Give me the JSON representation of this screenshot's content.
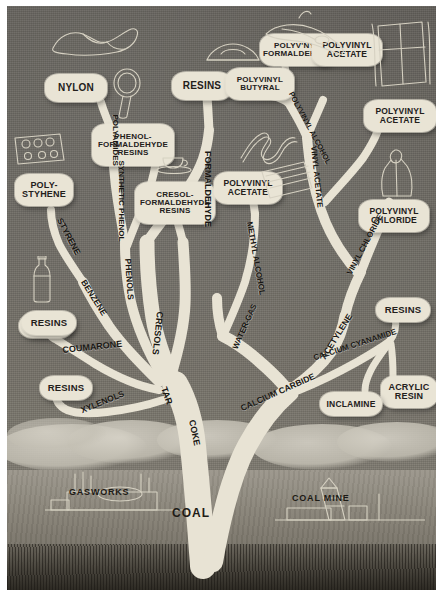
{
  "plate": {
    "title": "Chemical products derived from coal",
    "background_color": "#6e6a63",
    "limb_color": "#e8e3d4",
    "label_color": "#e9e4d5",
    "text_color": "#23201b"
  },
  "trunk": {
    "root_label": "COAL",
    "ground_left": "GASWORKS",
    "ground_right": "COAL MINE"
  },
  "branch_labels": [
    {
      "id": "tar",
      "text": "TAR"
    },
    {
      "id": "coke",
      "text": "COKE"
    },
    {
      "id": "water-gas",
      "text": "WATER-GAS"
    },
    {
      "id": "calcium-carbide",
      "text": "CALCIUM CARBIDE"
    },
    {
      "id": "calcium-cyanamide",
      "text": "CALCIUM CYANAMIDE"
    },
    {
      "id": "acetylene",
      "text": "ACETYLENE"
    },
    {
      "id": "vinyl-chloride",
      "text": "VINYL CHLORIDE"
    },
    {
      "id": "vinyl-acetate",
      "text": "VINYL ACETATE"
    },
    {
      "id": "polyvinyl-alcohol",
      "text": "POLYVINYL ALCOHOL"
    },
    {
      "id": "methyl-alcohol",
      "text": "METHYL ALCOHOL"
    },
    {
      "id": "formaldehyde",
      "text": "FORMALDEHYDE"
    },
    {
      "id": "cresols",
      "text": "CRESOLS"
    },
    {
      "id": "phenols",
      "text": "PHENOLS"
    },
    {
      "id": "benzene",
      "text": "BENZENE"
    },
    {
      "id": "coumarone",
      "text": "COUMARONE"
    },
    {
      "id": "xylenols",
      "text": "XYLENOLS"
    },
    {
      "id": "styrene",
      "text": "STYRENE"
    },
    {
      "id": "synthetic-phenol",
      "text": "SYNTHETIC PHENOL"
    },
    {
      "id": "polyamides",
      "text": "POLYAMIDES"
    }
  ],
  "products": [
    {
      "id": "nylon",
      "text": "NYLON"
    },
    {
      "id": "phenol-formaldehyde-resins",
      "text": "PHENOL-\nFORMALDEHYDE\nRESINS"
    },
    {
      "id": "cresol-formaldehyde-resins",
      "text": "CRESOL-\nFORMALDEHYDE\nRESINS"
    },
    {
      "id": "polystyrene",
      "text": "POLY-\nSTYHENE"
    },
    {
      "id": "resins-styrene",
      "text": "RESINS"
    },
    {
      "id": "resins-coumarone",
      "text": "RESINS"
    },
    {
      "id": "resins-xylenols",
      "text": "RESINS"
    },
    {
      "id": "resins-formaldehyde",
      "text": "RESINS"
    },
    {
      "id": "polyvinyl-formaldehyde",
      "text": "POLYV'NYL\nFORMALDEHYDE"
    },
    {
      "id": "polyvinyl-butyral",
      "text": "POLYVINYL\nBUTYRAL"
    },
    {
      "id": "polyvinyl-acetate-top",
      "text": "POLYVINYL\nACETATE"
    },
    {
      "id": "polyvinyl-acetate-right",
      "text": "POLYVINYL\nACETATE"
    },
    {
      "id": "polyvinyl-acetate-left",
      "text": "POLYVINYL\nACETATE"
    },
    {
      "id": "polyvinyl-chloride",
      "text": "POLYVINYL\nCHLORIDE"
    },
    {
      "id": "resins-cyanamide",
      "text": "RESINS"
    },
    {
      "id": "acrylic-resin",
      "text": "ACRYLIC\nRESIN"
    },
    {
      "id": "inclamine",
      "text": "INCLAMINE"
    }
  ],
  "icons": [
    {
      "id": "shoe-icon",
      "name": "shoe"
    },
    {
      "id": "hand-mirror-icon",
      "name": "hand-mirror"
    },
    {
      "id": "lampshade-icon",
      "name": "lampshade"
    },
    {
      "id": "radio-set-icon",
      "name": "radio-set"
    },
    {
      "id": "bottle-icon",
      "name": "bottle"
    },
    {
      "id": "teacup-icon",
      "name": "teacup-and-saucer"
    },
    {
      "id": "ribbon-icon",
      "name": "ribbon"
    },
    {
      "id": "handbag-icon",
      "name": "handbag"
    },
    {
      "id": "window-icon",
      "name": "curtained-window"
    },
    {
      "id": "raincoat-icon",
      "name": "raincoat"
    },
    {
      "id": "panel-icon",
      "name": "flat-panel"
    },
    {
      "id": "hose-icon",
      "name": "garden-hose"
    }
  ]
}
